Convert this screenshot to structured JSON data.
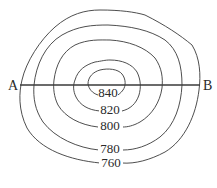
{
  "diagram": {
    "type": "contour-map",
    "section_line": {
      "start_label": "A",
      "end_label": "B"
    },
    "contours": [
      {
        "value": "760",
        "label": "760"
      },
      {
        "value": "780",
        "label": "780"
      },
      {
        "value": "800",
        "label": "800"
      },
      {
        "value": "820",
        "label": "820"
      },
      {
        "value": "840",
        "label": "840"
      }
    ]
  }
}
